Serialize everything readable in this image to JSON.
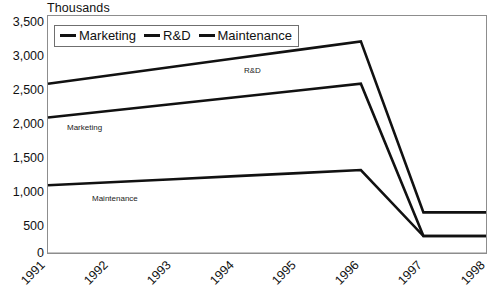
{
  "chart_data": {
    "type": "line",
    "title": "",
    "unit_caption": "Thousands",
    "xlabel": "",
    "ylabel": "",
    "categories": [
      "1991",
      "1992",
      "1993",
      "1994",
      "1995",
      "1996",
      "1997",
      "1998"
    ],
    "ylim": [
      0,
      3500
    ],
    "ytick_step": 500,
    "ytick_labels": [
      "3,500",
      "3,000",
      "2,500",
      "2,000",
      "1,500",
      "1,000",
      "500",
      "0"
    ],
    "ytick_values": [
      3500,
      3000,
      2500,
      2000,
      1500,
      1000,
      500,
      0
    ],
    "grid": false,
    "legend_position": "top-left-inside",
    "series": [
      {
        "name": "Marketing",
        "color": "#111111",
        "values": [
          2000,
          2100,
          2200,
          2300,
          2400,
          2500,
          250,
          250
        ]
      },
      {
        "name": "R&D",
        "color": "#111111",
        "values": [
          2500,
          2625,
          2750,
          2875,
          3000,
          3125,
          600,
          600
        ]
      },
      {
        "name": "Maintenance",
        "color": "#111111",
        "values": [
          1000,
          1045,
          1090,
          1135,
          1180,
          1225,
          250,
          250
        ]
      }
    ],
    "annotations": [
      {
        "text": "R&D",
        "series": "R&D"
      },
      {
        "text": "Marketing",
        "series": "Marketing"
      },
      {
        "text": "Maintenance",
        "series": "Maintenance"
      }
    ]
  },
  "legend": {
    "items": [
      {
        "label": "Marketing"
      },
      {
        "label": "R&D"
      },
      {
        "label": "Maintenance"
      }
    ]
  }
}
